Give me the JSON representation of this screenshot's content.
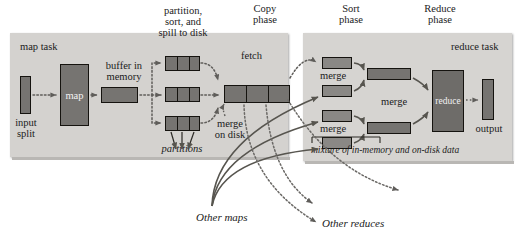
{
  "diagram": {
    "phases": [
      {
        "id": "copy",
        "label": "Copy\nphase"
      },
      {
        "id": "sort",
        "label": "Sort\nphase"
      },
      {
        "id": "reduce",
        "label": "Reduce\nphase"
      }
    ],
    "map_task": {
      "panel_label": "map task",
      "input_split_label": "input\nsplit",
      "map_box_label": "map",
      "buffer_label": "buffer in\nmemory",
      "spill_label": "partition,\nsort, and\nspill to disk",
      "partitions_label": "partitions",
      "merge_on_disk_label": "merge\non disk",
      "spill_files": 3,
      "partitions_per_spill": 3,
      "merged_segments": 3
    },
    "fetch_label": "fetch",
    "reduce_task": {
      "panel_label": "reduce task",
      "merge_label_1": "merge",
      "merge_label_2": "merge",
      "merge_label_final": "merge",
      "reduce_box_label": "reduce",
      "output_label": "output",
      "footnote": "mixture of in-memory and on-disk data",
      "fetched_chunks": 4,
      "merged_streams": 2
    },
    "other_maps_label": "Other maps",
    "other_reduces_label": "Other reduces",
    "colors": {
      "panel": "#d6d4d1",
      "box_fill": "#767471",
      "box_stroke": "#15130f",
      "solid_arrow": "#5d5b58",
      "dotted_arrow": "#6b6966",
      "text": "#1b1b1b",
      "box_text": "#f2f2f2",
      "page": "#ffffff"
    }
  }
}
